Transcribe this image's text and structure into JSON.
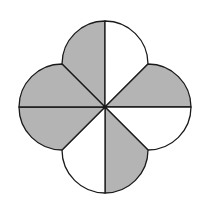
{
  "figure": {
    "center": [
      105,
      107
    ],
    "lobe_radius": 43,
    "colors": {
      "shaded": "#b4b4b4",
      "unshaded": "#ffffff",
      "stroke": "#1a1a1a"
    },
    "sectors": [
      {
        "name": "top-left",
        "shaded": true
      },
      {
        "name": "top-right",
        "shaded": false
      },
      {
        "name": "right-upper",
        "shaded": true
      },
      {
        "name": "right-lower",
        "shaded": false
      },
      {
        "name": "bottom-right",
        "shaded": true
      },
      {
        "name": "bottom-left",
        "shaded": false
      },
      {
        "name": "left-lower",
        "shaded": true
      },
      {
        "name": "left-upper",
        "shaded": true
      }
    ],
    "shaded_count": 5,
    "total_sectors": 8
  }
}
